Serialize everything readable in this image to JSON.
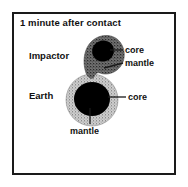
{
  "figure": {
    "title": "1 minute after contact",
    "bodies": [
      {
        "id": "impactor",
        "label": "Impactor"
      },
      {
        "id": "earth",
        "label": "Earth"
      }
    ],
    "callouts": [
      {
        "id": "impactor-core",
        "label": "core"
      },
      {
        "id": "impactor-mantle",
        "label": "mantle"
      },
      {
        "id": "earth-core",
        "label": "core"
      },
      {
        "id": "earth-mantle",
        "label": "mantle"
      }
    ],
    "colors": {
      "frame": "#1a1a1a",
      "background": "#ffffff",
      "core": "#000000",
      "impactor_mantle": "#6e6e6e",
      "earth_mantle": "#c2c2c2",
      "text": "#111111",
      "leader_line": "#1a1a1a"
    }
  }
}
